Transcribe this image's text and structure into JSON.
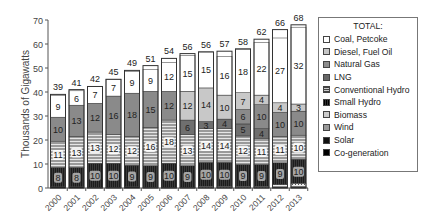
{
  "chart_data": {
    "type": "bar",
    "stacked": true,
    "title": "",
    "xlabel": "",
    "ylabel": "Thousands of Gigawatts",
    "ylim": [
      0,
      70
    ],
    "yticks": [
      0,
      10,
      20,
      30,
      40,
      50,
      60,
      70
    ],
    "grid": false,
    "legend_position": "right",
    "legend_title": "TOTAL:",
    "categories": [
      "2000",
      "2001",
      "2002",
      "2003",
      "2004",
      "2005",
      "2006",
      "2007",
      "2008",
      "2009",
      "2010",
      "2011",
      "2012",
      "2013"
    ],
    "totals": [
      39,
      41,
      42,
      45,
      49,
      51,
      54,
      56,
      56,
      57,
      58,
      62,
      66,
      68
    ],
    "series": [
      {
        "name": "Co-generation",
        "values": [
          0.5,
          0.5,
          0.3,
          0.3,
          0.5,
          0.3,
          0.3,
          0.3,
          0.3,
          0.3,
          0.3,
          0.3,
          0.3,
          0.3
        ],
        "color": "#111111"
      },
      {
        "name": "Solar",
        "values": [
          0,
          0,
          0,
          0,
          0,
          0,
          0,
          0,
          0,
          0,
          0,
          0,
          0.2,
          0.3
        ],
        "color": "#222222"
      },
      {
        "name": "Wind",
        "values": [
          0,
          0,
          0,
          0,
          0,
          0,
          0,
          0,
          0.4,
          0.4,
          0.4,
          0.4,
          1.0,
          1.4
        ],
        "color": "#cccccc"
      },
      {
        "name": "Biomass",
        "values": [
          0,
          0,
          0,
          0,
          0,
          0,
          0,
          0,
          0,
          0,
          0,
          0,
          0,
          0
        ],
        "color": "#bbbbbb"
      },
      {
        "name": "Small Hydro",
        "values": [
          8,
          8,
          10,
          10,
          9,
          9,
          10,
          9,
          10,
          10,
          9,
          9,
          9,
          10
        ],
        "color": "#2a2a2a",
        "labels": [
          8,
          8,
          10,
          10,
          9,
          9,
          10,
          9,
          10,
          10,
          9,
          9,
          9,
          10
        ]
      },
      {
        "name": "Conventional Hydro",
        "values": [
          11,
          13,
          13,
          12,
          12,
          16,
          18,
          13,
          14,
          14,
          12,
          11,
          11,
          10
        ],
        "color": "#9a9a9a",
        "labels": [
          11,
          13,
          13,
          12,
          12,
          16,
          18,
          13,
          14,
          14,
          12,
          11,
          11,
          10
        ]
      },
      {
        "name": "LNG",
        "values": [
          0,
          0,
          0,
          0,
          0,
          0,
          0,
          6,
          3,
          4,
          5,
          4,
          0,
          0
        ],
        "color": "#7a7a7a",
        "labels": [
          null,
          null,
          null,
          null,
          null,
          null,
          null,
          6,
          3,
          4,
          5,
          4,
          null,
          null
        ]
      },
      {
        "name": "Natural Gas",
        "values": [
          10,
          13,
          12,
          16,
          18,
          15,
          12,
          0,
          0,
          0,
          6,
          10,
          10,
          10
        ],
        "color": "#8c8c8c",
        "labels": [
          10,
          13,
          12,
          16,
          18,
          15,
          12,
          null,
          null,
          null,
          6,
          10,
          10,
          10
        ]
      },
      {
        "name": "Diesel, Fuel Oil",
        "values": [
          0,
          0,
          0,
          0,
          0,
          0,
          0,
          12,
          14,
          10,
          7,
          4,
          4,
          3
        ],
        "color": "#c6c6c6",
        "labels": [
          null,
          null,
          null,
          null,
          null,
          null,
          null,
          12,
          14,
          10,
          7,
          4,
          4,
          3
        ]
      },
      {
        "name": "Coal, Petcoke",
        "values": [
          9,
          6,
          7,
          7,
          9,
          9,
          12,
          15,
          15,
          16,
          18,
          22,
          27,
          32
        ],
        "color": "#ffffff",
        "labels": [
          9,
          6,
          7,
          7,
          9,
          9,
          12,
          15,
          15,
          16,
          18,
          22,
          27,
          32
        ]
      }
    ]
  },
  "legend": {
    "title": "TOTAL:",
    "items": [
      {
        "label": "Coal, Petcoke",
        "swatch": "#ffffff"
      },
      {
        "label": "Diesel, Fuel Oil",
        "swatch": "#c6c6c6"
      },
      {
        "label": "Natural Gas",
        "swatch": "#8c8c8c"
      },
      {
        "label": "LNG",
        "swatch": "#6e6e6e"
      },
      {
        "label": "Conventional Hydro",
        "swatch": "#5a5a5a"
      },
      {
        "label": "Small Hydro",
        "swatch": "#1c1c1c"
      },
      {
        "label": "Biomass",
        "swatch": "#bdbdbd"
      },
      {
        "label": "Wind",
        "swatch": "#9a9a9a"
      },
      {
        "label": "Solar",
        "swatch": "#111111"
      },
      {
        "label": "Co-generation",
        "swatch": "#000000"
      }
    ]
  }
}
